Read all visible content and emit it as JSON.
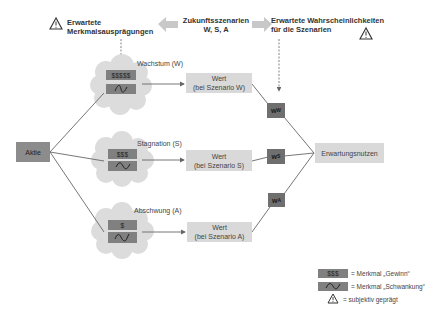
{
  "header": {
    "left_label_line1": "Erwartete",
    "left_label_line2": "Merkmalsausprägungen",
    "center_label_line1": "Zukunftsszenarien",
    "center_label_line2": "W, S, A",
    "right_label_line1": "Erwartete Wahrscheinlichkeiten",
    "right_label_line2": "für die Szenarien",
    "left_icon": "warning-triangle-icon",
    "right_icon": "warning-triangle-icon",
    "arrow_left": "arrow-left-icon",
    "arrow_right": "arrow-right-icon"
  },
  "root": {
    "label": "Aktie"
  },
  "scenarios": [
    {
      "name": "Wachstum (W)",
      "gain": "$$$$$",
      "volatility_icon": "wave-small-icon",
      "value_line1": "Wert",
      "value_line2": "(bei Szenario W)",
      "weight": "w",
      "weight_sub": "W"
    },
    {
      "name": "Stagnation (S)",
      "gain": "$$$",
      "volatility_icon": "wave-medium-icon",
      "value_line1": "Wert",
      "value_line2": "(bei Szenario S)",
      "weight": "w",
      "weight_sub": "S"
    },
    {
      "name": "Abschwung (A)",
      "gain": "$",
      "volatility_icon": "wave-large-icon",
      "value_line1": "Wert",
      "value_line2": "(bei Szenario A)",
      "weight": "w",
      "weight_sub": "A"
    }
  ],
  "result": {
    "label": "Erwartungsnutzen"
  },
  "legend": {
    "gain_swatch": "$$$",
    "gain_text": "= Merkmal „Gewinn“",
    "volatility_text": "= Merkmal „Schwankung“",
    "subjective_text": "= subjektiv geprägt"
  },
  "colors": {
    "light_box": "#d9d9d9",
    "feature_box": "#808080",
    "weight_box": "#6f6f6f",
    "root_box": "#8c8c8c",
    "cloud": "#dcdcdc",
    "line": "#666666",
    "arrow_fill": "#c8c8c8"
  }
}
